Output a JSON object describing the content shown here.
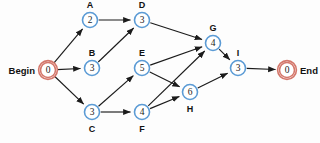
{
  "diagram": {
    "type": "activity-on-node network",
    "background_color": "#fdfdfd",
    "node_stroke_color": "#5b9bd5",
    "terminal_stroke_color": "#d4776b",
    "edge_color": "#1b1b1b"
  },
  "terminals": {
    "begin": {
      "label": "Begin",
      "value": "0",
      "cx": 48,
      "cy": 70,
      "r": 7.5
    },
    "end": {
      "label": "End",
      "value": "0",
      "cx": 287,
      "cy": 70,
      "r": 7.5
    }
  },
  "nodes": [
    {
      "id": "A",
      "label": "A",
      "value": "2",
      "cx": 90,
      "cy": 20,
      "r": 7.5,
      "label_pos": "above"
    },
    {
      "id": "D",
      "label": "D",
      "value": "3",
      "cx": 142,
      "cy": 20,
      "r": 7.5,
      "label_pos": "above"
    },
    {
      "id": "B",
      "label": "B",
      "value": "3",
      "cx": 92,
      "cy": 68,
      "r": 7.5,
      "label_pos": "above"
    },
    {
      "id": "E",
      "label": "E",
      "value": "5",
      "cx": 142,
      "cy": 68,
      "r": 7.5,
      "label_pos": "above"
    },
    {
      "id": "G",
      "label": "G",
      "value": "4",
      "cx": 213,
      "cy": 43,
      "r": 7.5,
      "label_pos": "above"
    },
    {
      "id": "I",
      "label": "I",
      "value": "3",
      "cx": 238,
      "cy": 68,
      "r": 7.5,
      "label_pos": "above"
    },
    {
      "id": "H",
      "label": "H",
      "value": "6",
      "cx": 190,
      "cy": 92,
      "r": 7.5,
      "label_pos": "below"
    },
    {
      "id": "C",
      "label": "C",
      "value": "3",
      "cx": 92,
      "cy": 112,
      "r": 7.5,
      "label_pos": "below"
    },
    {
      "id": "F",
      "label": "F",
      "value": "4",
      "cx": 142,
      "cy": 112,
      "r": 7.5,
      "label_pos": "below"
    }
  ],
  "edges": [
    {
      "from": "Begin",
      "to": "A"
    },
    {
      "from": "Begin",
      "to": "B"
    },
    {
      "from": "Begin",
      "to": "C"
    },
    {
      "from": "A",
      "to": "D"
    },
    {
      "from": "B",
      "to": "D"
    },
    {
      "from": "C",
      "to": "E"
    },
    {
      "from": "C",
      "to": "F"
    },
    {
      "from": "D",
      "to": "G"
    },
    {
      "from": "E",
      "to": "G"
    },
    {
      "from": "E",
      "to": "H"
    },
    {
      "from": "F",
      "to": "G"
    },
    {
      "from": "F",
      "to": "H"
    },
    {
      "from": "G",
      "to": "I"
    },
    {
      "from": "H",
      "to": "I"
    },
    {
      "from": "I",
      "to": "End"
    }
  ]
}
